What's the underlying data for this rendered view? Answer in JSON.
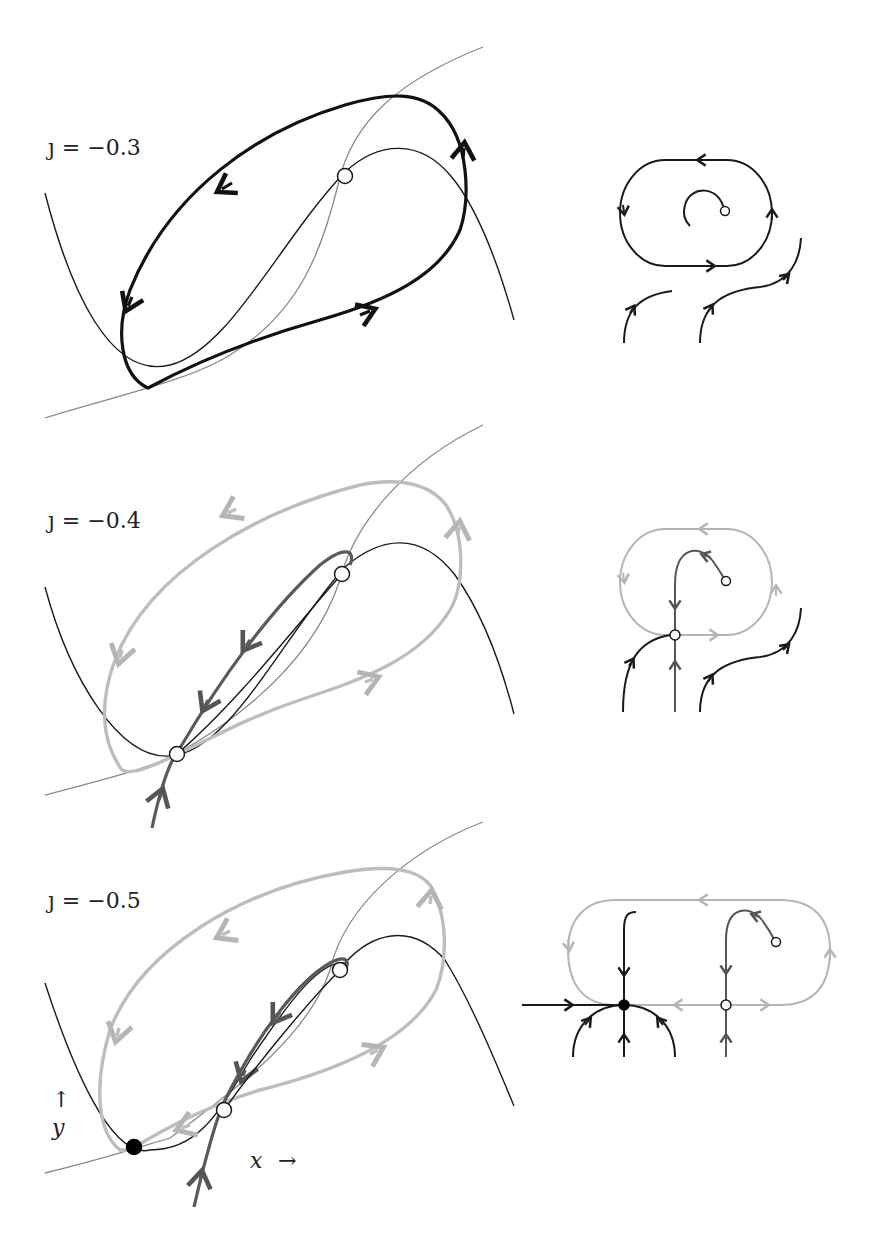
{
  "figure": {
    "panels": [
      {
        "id": "top",
        "label": "ȷ = −0.3",
        "param": -0.3
      },
      {
        "id": "middle",
        "label": "ȷ = −0.4",
        "param": -0.4
      },
      {
        "id": "bottom",
        "label": "ȷ = −0.5",
        "param": -0.5
      }
    ],
    "axes": {
      "y_label": "y",
      "y_arrow": "↑",
      "x_label": "x",
      "x_arrow": "→"
    },
    "colors": {
      "x_nullcline": "#1a1a1a",
      "y_nullcline": "#8a8a8a",
      "stable_orbit": "#111111",
      "unstable_orbit": "#bdbdbd",
      "manifold": "#5a5a5a"
    },
    "legend_notes": {
      "open_circle": "unstable / saddle equilibrium",
      "filled_circle": "stable equilibrium"
    }
  }
}
